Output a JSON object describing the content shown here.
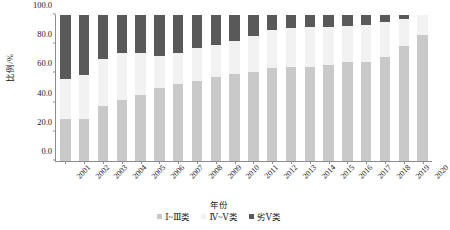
{
  "chart_data": {
    "type": "bar",
    "stacked": true,
    "title": "",
    "xlabel": "年份",
    "ylabel": "比例/%",
    "ylim": [
      0,
      100
    ],
    "yticks": [
      "0.0",
      "20.0",
      "40.0",
      "60.0",
      "80.0",
      "100.0"
    ],
    "ytick_values": [
      0,
      20,
      40,
      60,
      80,
      100
    ],
    "grid": false,
    "legend_position": "bottom",
    "categories": [
      "2001",
      "2002",
      "2003",
      "2004",
      "2005",
      "2006",
      "2007",
      "2008",
      "2009",
      "2010",
      "2011",
      "2012",
      "2013",
      "2014",
      "2015",
      "2016",
      "2017",
      "2018",
      "2019",
      "2020"
    ],
    "series": [
      {
        "name": "Ⅰ~Ⅲ类",
        "color": "#c9c9c9",
        "values": [
          29.0,
          29.0,
          38.0,
          41.5,
          45.5,
          50.0,
          52.5,
          55.0,
          57.5,
          59.5,
          61.0,
          64.0,
          64.5,
          64.5,
          66.0,
          67.5,
          68.0,
          71.0,
          79.0,
          86.0
        ]
      },
      {
        "name": "Ⅳ~Ⅴ类",
        "color": "#f2f2f2",
        "values": [
          27.0,
          30.0,
          32.0,
          32.5,
          28.5,
          22.0,
          21.5,
          22.5,
          22.0,
          23.0,
          24.5,
          25.5,
          26.5,
          27.0,
          26.0,
          25.0,
          25.5,
          24.5,
          18.0,
          14.0
        ]
      },
      {
        "name": "劣Ⅴ类",
        "color": "#595959",
        "values": [
          44.0,
          41.0,
          30.0,
          26.0,
          26.0,
          28.0,
          26.0,
          22.5,
          20.5,
          17.5,
          14.5,
          10.5,
          9.0,
          8.5,
          8.0,
          7.5,
          6.5,
          4.5,
          3.0,
          0.0
        ]
      }
    ],
    "legend_entries": [
      {
        "label": "Ⅰ~Ⅲ类",
        "color": "#c9c9c9"
      },
      {
        "label": "Ⅳ~Ⅴ类",
        "color": "#f2f2f2"
      },
      {
        "label": "劣Ⅴ类",
        "color": "#595959"
      }
    ]
  }
}
